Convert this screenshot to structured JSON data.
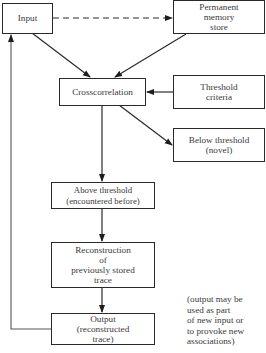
{
  "diagram": {
    "nodes": {
      "input": {
        "label": "Input"
      },
      "permanent_memory": {
        "label": "Permanent\nmemory\nstore"
      },
      "crosscorrelation": {
        "label": "Crosscorrelation"
      },
      "threshold_criteria": {
        "label": "Threshold\ncriteria"
      },
      "below_threshold": {
        "label": "Below threshold\n(novel)"
      },
      "above_threshold": {
        "label": "Above threshold\n(encountered  before)"
      },
      "reconstruction": {
        "label": "Reconstruction\nof\npreviously stored\ntrace"
      },
      "output": {
        "label": "Output\n(reconstructed\ntrace)"
      }
    },
    "annotation": "(output may be\nused as part\nof new input or\nto provoke new\nassociations)",
    "edges": [
      {
        "from": "input",
        "to": "permanent_memory",
        "style": "dashed"
      },
      {
        "from": "input",
        "to": "crosscorrelation",
        "style": "solid"
      },
      {
        "from": "permanent_memory",
        "to": "crosscorrelation",
        "style": "solid"
      },
      {
        "from": "threshold_criteria",
        "to": "crosscorrelation",
        "style": "solid"
      },
      {
        "from": "crosscorrelation",
        "to": "below_threshold",
        "style": "solid"
      },
      {
        "from": "crosscorrelation",
        "to": "above_threshold",
        "style": "solid"
      },
      {
        "from": "above_threshold",
        "to": "reconstruction",
        "style": "solid"
      },
      {
        "from": "reconstruction",
        "to": "output",
        "style": "solid"
      },
      {
        "from": "output",
        "to": "input",
        "style": "solid",
        "routing": "feedback-left"
      }
    ]
  }
}
